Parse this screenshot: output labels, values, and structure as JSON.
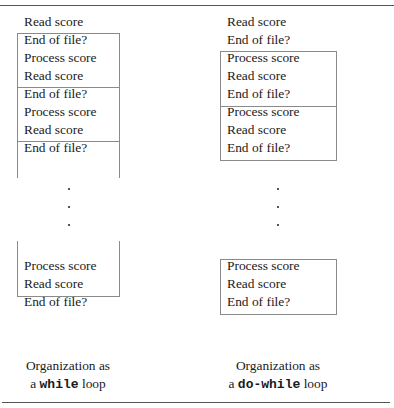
{
  "left_column": {
    "lines": [
      "Read score",
      "End of file?",
      "Process score",
      "Read score",
      "End of file?",
      "Process score",
      "Read score",
      "End of file?"
    ],
    "dots": [
      ".",
      ".",
      "."
    ],
    "tail_lines": [
      "Process score",
      "Read score",
      "End of file?"
    ],
    "caption_line1": "Organization as",
    "caption_prefix": "a ",
    "caption_code": "while",
    "caption_suffix": " loop"
  },
  "right_column": {
    "lines": [
      "Read score",
      "End of file?",
      "Process score",
      "Read score",
      "End of file?",
      "Process score",
      "Read score",
      "End of file?"
    ],
    "dots": [
      ".",
      ".",
      "."
    ],
    "tail_lines": [
      "Process score",
      "Read score",
      "End of file?"
    ],
    "caption_line1": "Organization as",
    "caption_prefix": "a ",
    "caption_code": "do-while",
    "caption_suffix": " loop"
  }
}
